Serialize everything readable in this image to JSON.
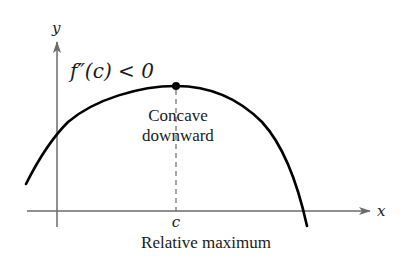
{
  "diagram": {
    "axes": {
      "x_label": "x",
      "y_label": "y",
      "axis_color": "#6b6b6b"
    },
    "condition_label": "f″(c) < 0",
    "concavity_label_line1": "Concave",
    "concavity_label_line2": "downward",
    "point_label": "c",
    "caption": "Relative maximum",
    "curve_color": "#000000",
    "dashed_color": "#6b6b6b"
  }
}
